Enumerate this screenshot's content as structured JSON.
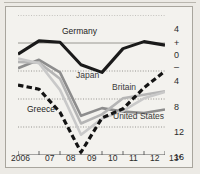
{
  "chart_data": {
    "type": "line",
    "title": "",
    "xlabel": "",
    "ylabel": "",
    "x": [
      "2006",
      "07",
      "08",
      "09",
      "10",
      "11",
      "12",
      "13*"
    ],
    "x_tick_labels": [
      "2006",
      "07",
      "08",
      "09",
      "10",
      "11",
      "12",
      "13*"
    ],
    "y_tick_labels": [
      "4",
      "+",
      "0",
      "–",
      "4",
      "8",
      "12",
      "16"
    ],
    "y_tick_values": [
      4,
      null,
      0,
      null,
      -4,
      -8,
      -12,
      -16
    ],
    "ylim": [
      -16,
      4
    ],
    "grid": "horizontal-dotted",
    "legend": "inline-labels",
    "series": [
      {
        "name": "Germany",
        "style": "solid",
        "color": "#1a1a1a",
        "width": 3.1,
        "label_x": 62,
        "label_y": 26,
        "values": [
          -1.6,
          0.3,
          0.1,
          -3.1,
          -4.2,
          -0.8,
          0.2,
          -0.3
        ]
      },
      {
        "name": "Greece",
        "style": "dashed",
        "color": "#141414",
        "width": 3.2,
        "label_x": 27,
        "label_y": 104,
        "values": [
          -6.0,
          -6.6,
          -9.9,
          -15.6,
          -10.7,
          -9.4,
          -6.4,
          -4.0
        ]
      },
      {
        "name": "Japan",
        "style": "solid",
        "color": "#8d8d8d",
        "width": 2.6,
        "label_x": 76,
        "label_y": 70,
        "values": [
          -3.6,
          -2.4,
          -4.2,
          -10.4,
          -9.3,
          -9.8,
          -10.0,
          -9.5
        ]
      },
      {
        "name": "Britain",
        "style": "solid",
        "color": "#b5b5b5",
        "width": 2.6,
        "label_x": 112,
        "label_y": 82,
        "values": [
          -2.7,
          -2.8,
          -5.1,
          -11.5,
          -10.2,
          -7.9,
          -7.4,
          -6.9
        ]
      },
      {
        "name": "United States",
        "style": "solid",
        "color": "#c9c9c9",
        "width": 2.6,
        "label_x": 113,
        "label_y": 111,
        "values": [
          -2.2,
          -2.9,
          -6.7,
          -13.1,
          -10.8,
          -9.7,
          -7.9,
          -7.0
        ]
      }
    ],
    "gridlines": [
      4,
      0,
      -4,
      -8,
      -12,
      -16
    ],
    "zero_line": 0,
    "note": "13* denotes forecast"
  },
  "axis": {
    "y_ticks": [
      {
        "label": "4",
        "top": 12
      },
      {
        "label": "+",
        "top": 26
      },
      {
        "label": "0",
        "top": 38
      },
      {
        "label": "–",
        "top": 50
      },
      {
        "label": "4",
        "top": 64
      },
      {
        "label": "8",
        "top": 90
      },
      {
        "label": "12",
        "top": 115
      },
      {
        "label": "16",
        "top": 140
      }
    ],
    "x_ticks": [
      {
        "label": "2006",
        "left": 6
      },
      {
        "label": "07",
        "left": 40
      },
      {
        "label": "08",
        "left": 61
      },
      {
        "label": "09",
        "left": 82
      },
      {
        "label": "10",
        "left": 103
      },
      {
        "label": "11",
        "left": 124
      },
      {
        "label": "12",
        "left": 145
      },
      {
        "label": "13*",
        "left": 164
      }
    ]
  },
  "colors": {
    "background": "#f3f2ee",
    "frame": "#a8a59d",
    "grid": "#9c9a94",
    "germany": "#1a1a1a",
    "greece": "#141414",
    "japan": "#8d8d8d",
    "britain": "#b5b5b5",
    "united_states": "#c9c9c9"
  }
}
